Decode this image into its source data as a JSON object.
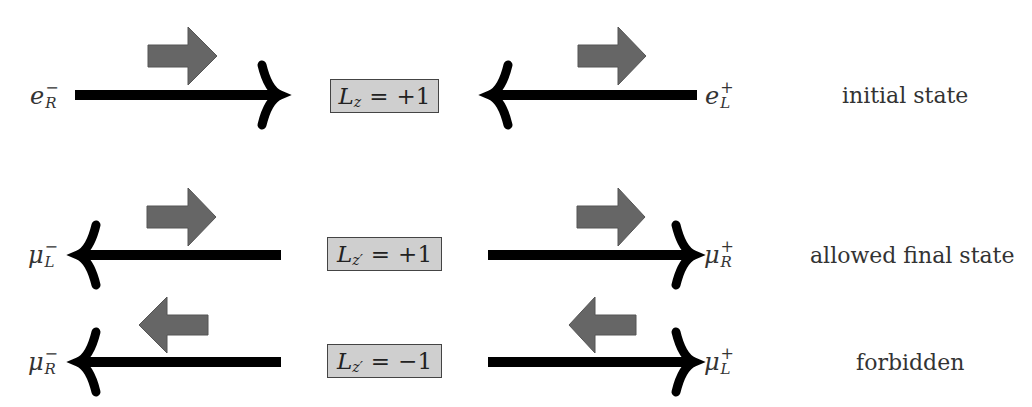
{
  "rows": [
    {
      "id": "initial",
      "left_particle": {
        "base": "e",
        "charge": "−",
        "helicity": "R"
      },
      "right_particle": {
        "base": "e",
        "charge": "+",
        "helicity": "L"
      },
      "box": {
        "symbol": "L",
        "subscript": "z",
        "eq": "=",
        "value": "+1"
      },
      "state_label": "initial state"
    },
    {
      "id": "allowed",
      "left_particle": {
        "base": "μ",
        "charge": "−",
        "helicity": "L"
      },
      "right_particle": {
        "base": "μ",
        "charge": "+",
        "helicity": "R"
      },
      "box": {
        "symbol": "L",
        "subscript": "z′",
        "eq": "=",
        "value": "+1"
      },
      "state_label": "allowed final state"
    },
    {
      "id": "forbidden",
      "left_particle": {
        "base": "μ",
        "charge": "−",
        "helicity": "R"
      },
      "right_particle": {
        "base": "μ",
        "charge": "+",
        "helicity": "L"
      },
      "box": {
        "symbol": "L",
        "subscript": "z′",
        "eq": "=",
        "value": "−1"
      },
      "state_label": "forbidden"
    }
  ],
  "colors": {
    "momentum_arrow": "#000000",
    "spin_arrow": "#666666",
    "box_fill": "#cfcfcf",
    "box_border": "#444444"
  }
}
